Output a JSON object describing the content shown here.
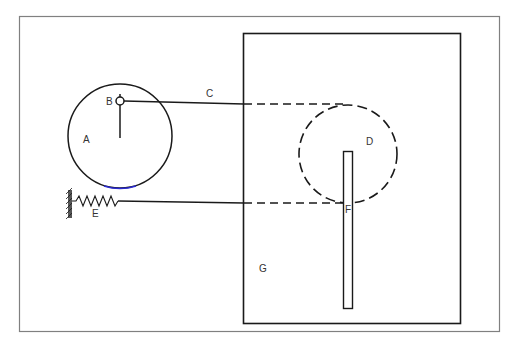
{
  "diagram": {
    "labels": {
      "A": "A",
      "B": "B",
      "C": "C",
      "D": "D",
      "E": "E",
      "F": "F",
      "G": "G"
    },
    "colors": {
      "line": "#1a1a1a",
      "frame": "#808080",
      "accent_arc": "#2a2ad0",
      "background": "#ffffff"
    }
  }
}
